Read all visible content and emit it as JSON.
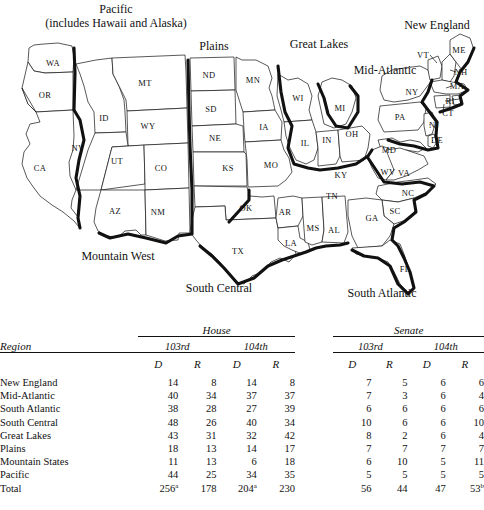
{
  "map": {
    "regions": [
      {
        "name": "Pacific",
        "label": "Pacific",
        "sublabel": "(includes Hawaii and Alaska)",
        "x": 116,
        "y": 16
      },
      {
        "name": "Plains",
        "label": "Plains",
        "x": 214,
        "y": 46
      },
      {
        "name": "Great Lakes",
        "label": "Great Lakes",
        "x": 319,
        "y": 44
      },
      {
        "name": "Mid-Atlantic",
        "label": "Mid-Atlantic",
        "x": 385,
        "y": 70
      },
      {
        "name": "New England",
        "label": "New England",
        "x": 437,
        "y": 25
      },
      {
        "name": "Mountain West",
        "label": "Mountain West",
        "x": 118,
        "y": 256
      },
      {
        "name": "South Central",
        "label": "South Central",
        "x": 219,
        "y": 288
      },
      {
        "name": "South Atlantic",
        "label": "South Atlantic",
        "x": 382,
        "y": 293
      }
    ],
    "states": [
      {
        "code": "WA",
        "x": 53,
        "y": 63
      },
      {
        "code": "OR",
        "x": 45,
        "y": 95
      },
      {
        "code": "CA",
        "x": 40,
        "y": 168
      },
      {
        "code": "NV",
        "x": 78,
        "y": 148
      },
      {
        "code": "ID",
        "x": 104,
        "y": 118
      },
      {
        "code": "UT",
        "x": 117,
        "y": 161
      },
      {
        "code": "AZ",
        "x": 115,
        "y": 211
      },
      {
        "code": "MT",
        "x": 145,
        "y": 83
      },
      {
        "code": "WY",
        "x": 148,
        "y": 126
      },
      {
        "code": "CO",
        "x": 161,
        "y": 168
      },
      {
        "code": "NM",
        "x": 158,
        "y": 212
      },
      {
        "code": "ND",
        "x": 209,
        "y": 75
      },
      {
        "code": "SD",
        "x": 211,
        "y": 109
      },
      {
        "code": "NE",
        "x": 215,
        "y": 138
      },
      {
        "code": "KS",
        "x": 228,
        "y": 168
      },
      {
        "code": "OK",
        "x": 246,
        "y": 208
      },
      {
        "code": "TX",
        "x": 238,
        "y": 251
      },
      {
        "code": "MN",
        "x": 253,
        "y": 80
      },
      {
        "code": "IA",
        "x": 264,
        "y": 127
      },
      {
        "code": "MO",
        "x": 271,
        "y": 165
      },
      {
        "code": "AR",
        "x": 285,
        "y": 212
      },
      {
        "code": "LA",
        "x": 291,
        "y": 243
      },
      {
        "code": "MS",
        "x": 313,
        "y": 228
      },
      {
        "code": "AL",
        "x": 334,
        "y": 230
      },
      {
        "code": "WI",
        "x": 298,
        "y": 98
      },
      {
        "code": "IL",
        "x": 305,
        "y": 143
      },
      {
        "code": "IN",
        "x": 327,
        "y": 140
      },
      {
        "code": "MI",
        "x": 340,
        "y": 108
      },
      {
        "code": "OH",
        "x": 352,
        "y": 134
      },
      {
        "code": "KY",
        "x": 341,
        "y": 175
      },
      {
        "code": "TN",
        "x": 332,
        "y": 196
      },
      {
        "code": "GA",
        "x": 372,
        "y": 218
      },
      {
        "code": "SC",
        "x": 395,
        "y": 211
      },
      {
        "code": "NC",
        "x": 408,
        "y": 193
      },
      {
        "code": "VA",
        "x": 404,
        "y": 173
      },
      {
        "code": "WV",
        "x": 388,
        "y": 172
      },
      {
        "code": "MD",
        "x": 389,
        "y": 150
      },
      {
        "code": "DE",
        "x": 437,
        "y": 140
      },
      {
        "code": "NJ",
        "x": 434,
        "y": 125
      },
      {
        "code": "PA",
        "x": 400,
        "y": 117
      },
      {
        "code": "NY",
        "x": 412,
        "y": 92
      },
      {
        "code": "CT",
        "x": 448,
        "y": 113
      },
      {
        "code": "RI",
        "x": 450,
        "y": 101
      },
      {
        "code": "MA",
        "x": 457,
        "y": 86
      },
      {
        "code": "NH",
        "x": 461,
        "y": 72
      },
      {
        "code": "VT",
        "x": 423,
        "y": 55
      },
      {
        "code": "ME",
        "x": 459,
        "y": 50
      },
      {
        "code": "FL",
        "x": 405,
        "y": 269
      }
    ]
  },
  "table": {
    "region_header": "Region",
    "chambers": [
      {
        "name": "House",
        "congresses": [
          "103rd",
          "104th"
        ]
      },
      {
        "name": "Senate",
        "congresses": [
          "103rd",
          "104th"
        ]
      }
    ],
    "party_headers": [
      "D",
      "R",
      "D",
      "R",
      "D",
      "R",
      "D",
      "R"
    ],
    "rows": [
      {
        "region": "New England",
        "house_103_d": "14",
        "house_103_r": "8",
        "house_104_d": "14",
        "house_104_r": "8",
        "senate_103_d": "7",
        "senate_103_r": "5",
        "senate_104_d": "6",
        "senate_104_r": "6"
      },
      {
        "region": "Mid-Atlantic",
        "house_103_d": "40",
        "house_103_r": "34",
        "house_104_d": "37",
        "house_104_r": "37",
        "senate_103_d": "7",
        "senate_103_r": "3",
        "senate_104_d": "6",
        "senate_104_r": "4"
      },
      {
        "region": "South Atlantic",
        "house_103_d": "38",
        "house_103_r": "28",
        "house_104_d": "27",
        "house_104_r": "39",
        "senate_103_d": "6",
        "senate_103_r": "6",
        "senate_104_d": "6",
        "senate_104_r": "6"
      },
      {
        "region": "South Central",
        "house_103_d": "48",
        "house_103_r": "26",
        "house_104_d": "40",
        "house_104_r": "34",
        "senate_103_d": "10",
        "senate_103_r": "6",
        "senate_104_d": "6",
        "senate_104_r": "10"
      },
      {
        "region": "Great Lakes",
        "house_103_d": "43",
        "house_103_r": "31",
        "house_104_d": "32",
        "house_104_r": "42",
        "senate_103_d": "8",
        "senate_103_r": "2",
        "senate_104_d": "6",
        "senate_104_r": "4"
      },
      {
        "region": "Plains",
        "house_103_d": "18",
        "house_103_r": "13",
        "house_104_d": "14",
        "house_104_r": "17",
        "senate_103_d": "7",
        "senate_103_r": "7",
        "senate_104_d": "7",
        "senate_104_r": "7"
      },
      {
        "region": "Mountain States",
        "house_103_d": "11",
        "house_103_r": "13",
        "house_104_d": "6",
        "house_104_r": "18",
        "senate_103_d": "6",
        "senate_103_r": "10",
        "senate_104_d": "5",
        "senate_104_r": "11"
      },
      {
        "region": "Pacific",
        "house_103_d": "44",
        "house_103_r": "25",
        "house_104_d": "34",
        "house_104_r": "35",
        "senate_103_d": "5",
        "senate_103_r": "5",
        "senate_104_d": "5",
        "senate_104_r": "5"
      }
    ],
    "total": {
      "region": "Total",
      "house_103_d": "256",
      "house_103_d_note": "a",
      "house_103_r": "178",
      "house_103_r_note": "",
      "house_104_d": "204",
      "house_104_d_note": "a",
      "house_104_r": "230",
      "house_104_r_note": "",
      "senate_103_d": "56",
      "senate_103_d_note": "",
      "senate_103_r": "44",
      "senate_103_r_note": "",
      "senate_104_d": "47",
      "senate_104_d_note": "",
      "senate_104_r": "53",
      "senate_104_r_note": "b"
    }
  }
}
